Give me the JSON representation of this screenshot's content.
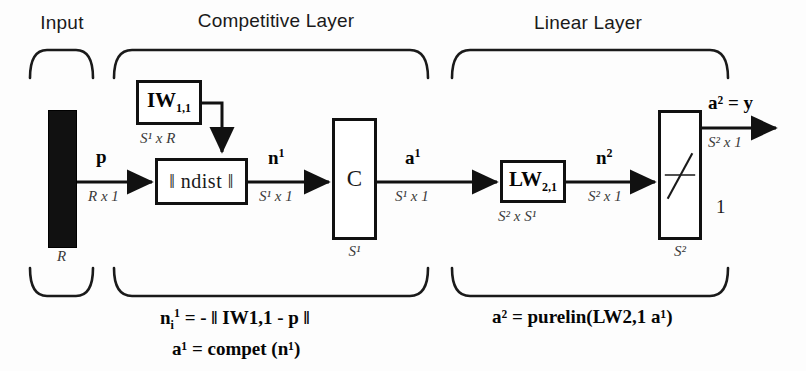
{
  "diagram": {
    "groups": [
      {
        "id": "input",
        "label": "Input"
      },
      {
        "id": "competitive",
        "label": "Competitive  Layer"
      },
      {
        "id": "linear",
        "label": "Linear Layer"
      }
    ],
    "input_block": {
      "bar_label": "R",
      "signal_label": "p",
      "signal_dim": "R x 1"
    },
    "competitive_layer": {
      "weight_box": {
        "label": "IW",
        "subscript": "1,1"
      },
      "weight_dim": "S¹ x R",
      "distance_box": {
        "label": "‖ ndist ‖"
      },
      "net_input_label": "n",
      "net_input_sup": "1",
      "net_input_dim": "S¹ x 1",
      "transfer_box": {
        "label": "C"
      },
      "transfer_dim": "S¹",
      "output_label": "a",
      "output_sup": "1",
      "output_dim": "S¹ x 1"
    },
    "linear_layer": {
      "weight_box": {
        "label": "LW",
        "subscript": "2,1"
      },
      "weight_dim": "S² x S¹",
      "net_input_label": "n",
      "net_input_sup": "2",
      "net_input_dim": "S² x 1",
      "transfer_box": {
        "label": "purelin-symbol"
      },
      "transfer_dim": "S²",
      "bias_marker": "1",
      "output_label": "a² = y",
      "output_dim": "S² x 1"
    },
    "equations": {
      "competitive": [
        {
          "lhs": "n",
          "lhs_sub": "i",
          "lhs_sup": "1",
          "rhs": "= - ‖  IW1,1 - p ‖",
          "text": "n i 1 = - || i IW 1,1 - p ||"
        },
        {
          "text": "a¹ = compet (n¹)"
        }
      ],
      "linear": [
        {
          "text": "a² = purelin(LW2,1 a¹)"
        }
      ]
    },
    "colors": {
      "ink": "#111111",
      "input_bar": "#111111",
      "background": "#ffffff",
      "dim_text": "#3a3a3a"
    }
  }
}
